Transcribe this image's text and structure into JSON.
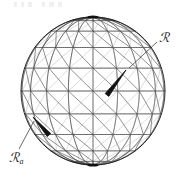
{
  "figure": {
    "type": "wireframe-sphere-diagram",
    "background_color": "#ffffff",
    "line_color": "#2b2b2b",
    "arrow_color": "#111111",
    "width": 184,
    "height": 181
  },
  "sphere": {
    "name": "wireframe-globe",
    "center_x": 93,
    "center_y": 91,
    "radius_x": 72,
    "radius_y": 74,
    "tilt_degrees": 0,
    "latitude_lines": 9,
    "longitude_lines": 18,
    "diagonal_mesh": true,
    "pole_marker_top": true,
    "pole_marker_bottom": true
  },
  "vectors": [
    {
      "id": "vector-r",
      "label": "ℛ",
      "label_plain": "R",
      "subscript": "",
      "tail_x": 107,
      "tail_y": 95,
      "tip_x": 126,
      "tip_y": 70,
      "leader_from_x": 129,
      "leader_from_y": 68,
      "leader_to_x": 157,
      "leader_to_y": 42
    },
    {
      "id": "vector-ra",
      "label": "ℛ",
      "label_plain": "R",
      "subscript": "a",
      "tail_x": 49,
      "tail_y": 135,
      "tip_x": 33,
      "tip_y": 117,
      "leader_from_x": 34,
      "leader_from_y": 121,
      "leader_to_x": 19,
      "leader_to_y": 149
    }
  ],
  "labels": {
    "r": {
      "text": "ℛ",
      "subscript": ""
    },
    "ra": {
      "text": "ℛ",
      "subscript": "a"
    }
  }
}
